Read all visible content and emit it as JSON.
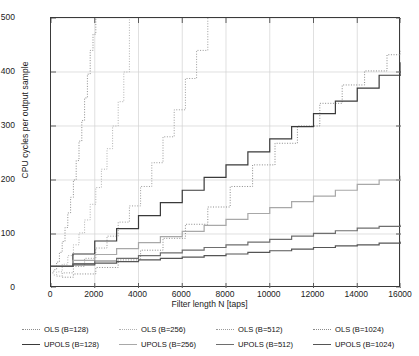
{
  "chart_data": {
    "type": "line",
    "title": "",
    "xlabel": "Filter length N [taps]",
    "ylabel": "CPU cycles per output sample",
    "xlim": [
      0,
      16000
    ],
    "ylim": [
      0,
      500
    ],
    "xticks": [
      0,
      2000,
      4000,
      6000,
      8000,
      10000,
      12000,
      14000,
      16000
    ],
    "yticks": [
      0,
      100,
      200,
      300,
      400,
      500
    ],
    "grid": true,
    "legend_position": "below",
    "series": [
      {
        "name": "OLS (B=128)",
        "style": "dotted",
        "color": "#8c8c8c",
        "block_size": 128,
        "x": [
          64,
          128,
          256,
          384,
          512,
          640,
          768,
          896,
          1024,
          1152,
          1280,
          1408,
          1536,
          1664,
          1792,
          1920,
          2048
        ],
        "values": [
          28,
          34,
          48,
          66,
          86,
          112,
          139,
          168,
          200,
          236,
          272,
          310,
          352,
          396,
          440,
          470,
          500
        ]
      },
      {
        "name": "OLS (B=256)",
        "style": "dotted",
        "color": "#b0b0b0",
        "block_size": 256,
        "x": [
          128,
          256,
          512,
          768,
          1024,
          1280,
          1536,
          1792,
          2048,
          2304,
          2560,
          2816,
          3072,
          3328,
          3584
        ],
        "values": [
          24,
          30,
          44,
          60,
          80,
          102,
          126,
          155,
          186,
          220,
          258,
          300,
          345,
          400,
          500
        ]
      },
      {
        "name": "OLS (B=512)",
        "style": "dotted",
        "color": "#9a9a9a",
        "block_size": 512,
        "x": [
          256,
          512,
          1024,
          1536,
          2048,
          2560,
          3072,
          3584,
          4096,
          4608,
          5120,
          5632,
          6144,
          6656,
          7168
        ],
        "values": [
          22,
          28,
          40,
          55,
          74,
          96,
          122,
          152,
          188,
          232,
          280,
          330,
          388,
          440,
          500
        ]
      },
      {
        "name": "OLS (B=1024)",
        "style": "dotted",
        "color": "#8a8a8a",
        "block_size": 1024,
        "x": [
          512,
          1024,
          2048,
          3072,
          4096,
          5120,
          6144,
          7168,
          8192,
          9216,
          10240,
          11264,
          12288,
          13312,
          14336,
          15360,
          16000
        ],
        "values": [
          20,
          26,
          38,
          52,
          70,
          92,
          118,
          150,
          188,
          228,
          268,
          300,
          342,
          376,
          402,
          432,
          440
        ]
      },
      {
        "name": "UPOLS (B=128)",
        "style": "solid",
        "color": "#3a3a3a",
        "block_size": 128,
        "x": [
          0,
          1000,
          2000,
          3000,
          4000,
          5000,
          6000,
          7000,
          8000,
          9000,
          10000,
          11000,
          12000,
          13000,
          14000,
          15000,
          16000
        ],
        "values": [
          40,
          63,
          87,
          110,
          134,
          158,
          181,
          205,
          228,
          252,
          276,
          299,
          323,
          346,
          370,
          394,
          418
        ]
      },
      {
        "name": "UPOLS (B=256)",
        "style": "solid",
        "color": "#a8a8a8",
        "block_size": 256,
        "x": [
          0,
          1000,
          2000,
          3000,
          4000,
          5000,
          6000,
          7000,
          8000,
          9000,
          10000,
          11000,
          12000,
          13000,
          14000,
          15000,
          16000
        ],
        "values": [
          40,
          51,
          62,
          73,
          84,
          95,
          105,
          116,
          127,
          138,
          149,
          160,
          170,
          181,
          192,
          200,
          208
        ]
      },
      {
        "name": "UPOLS (B=512)",
        "style": "solid",
        "color": "#6e6e6e",
        "block_size": 512,
        "x": [
          0,
          1000,
          2000,
          3000,
          4000,
          5000,
          6000,
          7000,
          8000,
          9000,
          10000,
          11000,
          12000,
          13000,
          14000,
          15000,
          16000
        ],
        "values": [
          40,
          45,
          50,
          55,
          60,
          65,
          70,
          75,
          80,
          85,
          90,
          96,
          101,
          106,
          111,
          114,
          117
        ]
      },
      {
        "name": "UPOLS (B=1024)",
        "style": "solid",
        "color": "#555555",
        "block_size": 1024,
        "x": [
          0,
          1000,
          2000,
          3000,
          4000,
          5000,
          6000,
          7000,
          8000,
          9000,
          10000,
          11000,
          12000,
          13000,
          14000,
          15000,
          16000
        ],
        "values": [
          40,
          43,
          46,
          49,
          52,
          55,
          57,
          60,
          63,
          66,
          69,
          72,
          75,
          78,
          80,
          83,
          86
        ]
      }
    ]
  },
  "legend": {
    "items": [
      {
        "label": "OLS (B=128)",
        "style": "dotted",
        "color": "#8c8c8c"
      },
      {
        "label": "OLS (B=256)",
        "style": "dotted",
        "color": "#b0b0b0"
      },
      {
        "label": "OLS (B=512)",
        "style": "dotted",
        "color": "#9a9a9a"
      },
      {
        "label": "OLS (B=1024)",
        "style": "dotted",
        "color": "#8a8a8a"
      },
      {
        "label": "UPOLS (B=128)",
        "style": "solid",
        "color": "#3a3a3a"
      },
      {
        "label": "UPOLS (B=256)",
        "style": "solid",
        "color": "#a8a8a8"
      },
      {
        "label": "UPOLS (B=512)",
        "style": "solid",
        "color": "#6e6e6e"
      },
      {
        "label": "UPOLS (B=1024)",
        "style": "solid",
        "color": "#555555"
      }
    ]
  }
}
